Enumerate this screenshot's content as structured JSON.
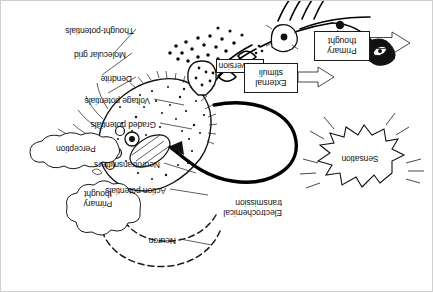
{
  "figure": {
    "orientation": "rotated-180",
    "labels": {
      "thought_potentials": "Thought-potentials",
      "molecular_grid": "Molecular grid",
      "dendrite": "Dendrite",
      "voltage_potentials": "Voltage potentials",
      "graded_potentials": "Graded potentials",
      "neurotransmitters": "Neurotransmitters",
      "action_potentials": "Action potentials",
      "neuron": "Neuron",
      "electrochemical_line1": "Electrochemical",
      "electrochemical_line2": "transmission",
      "receptor": "Receptor"
    },
    "boxes": {
      "conversion": "Conversion",
      "primary_thought_line1": "Primary",
      "primary_thought_line2": "thought",
      "external_stimuli_line1": "External",
      "external_stimuli_line2": "stimuli"
    },
    "clouds": {
      "primary_thought_line1": "Primary",
      "primary_thought_line2": "thought",
      "perception": "Perception"
    },
    "burst": {
      "sensation": "Sensation"
    },
    "colors": {
      "ink": "#111111",
      "paper": "#ffffff",
      "border": "#cfcfcf"
    }
  }
}
